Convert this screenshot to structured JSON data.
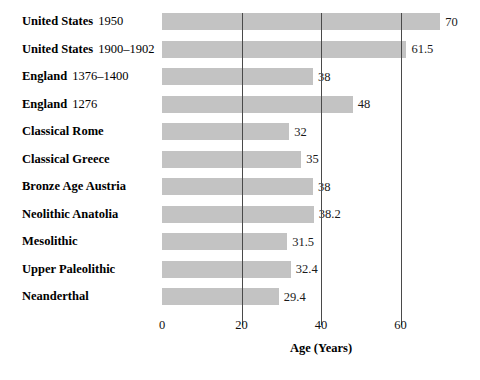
{
  "chart_data": {
    "type": "bar",
    "orientation": "horizontal",
    "title": "",
    "subtitle": "",
    "xlabel": "Age (Years)",
    "ylabel": "",
    "xlim": [
      0,
      80
    ],
    "xticks": [
      0,
      20,
      40,
      60
    ],
    "xtick_labels": [
      "0",
      "20",
      "40",
      "60"
    ],
    "grid": "vertical-only",
    "legend": "none",
    "bar_color": "#c3c3c3",
    "categories": [
      "United States 1950",
      "United States 1900–1902",
      "England 1376–1400",
      "England 1276",
      "Classical Rome",
      "Classical Greece",
      "Bronze Age Austria",
      "Neolithic Anatolia",
      "Mesolithic",
      "Upper Paleolithic",
      "Neanderthal"
    ],
    "values": [
      70,
      61.5,
      38,
      48,
      32,
      35,
      38,
      38.2,
      31.5,
      32.4,
      29.4
    ],
    "data_labels": [
      "70",
      "61.5",
      "38",
      "48",
      "32",
      "35",
      "38",
      "38.2",
      "31.5",
      "32.4",
      "29.4"
    ],
    "rows": [
      {
        "place": "United States",
        "period": "1950",
        "value": 70,
        "label": "70"
      },
      {
        "place": "United States",
        "period": "1900–1902",
        "value": 61.5,
        "label": "61.5"
      },
      {
        "place": "England",
        "period": "1376–1400",
        "value": 38,
        "label": "38"
      },
      {
        "place": "England",
        "period": "1276",
        "value": 48,
        "label": "48"
      },
      {
        "place": "Classical Rome",
        "period": "",
        "value": 32,
        "label": "32"
      },
      {
        "place": "Classical Greece",
        "period": "",
        "value": 35,
        "label": "35"
      },
      {
        "place": "Bronze Age Austria",
        "period": "",
        "value": 38,
        "label": "38"
      },
      {
        "place": "Neolithic Anatolia",
        "period": "",
        "value": 38.2,
        "label": "38.2"
      },
      {
        "place": "Mesolithic",
        "period": "",
        "value": 31.5,
        "label": "31.5"
      },
      {
        "place": "Upper Paleolithic",
        "period": "",
        "value": 32.4,
        "label": "32.4"
      },
      {
        "place": "Neanderthal",
        "period": "",
        "value": 29.4,
        "label": "29.4"
      }
    ]
  }
}
